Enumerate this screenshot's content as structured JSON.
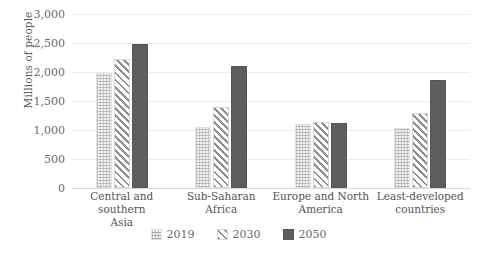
{
  "chart_data": {
    "type": "bar",
    "title": "",
    "xlabel": "",
    "ylabel": "Millions of people",
    "ylim": [
      0,
      3000
    ],
    "ytick_labels": [
      "3,000",
      "2,500",
      "2,000",
      "1,500",
      "1,000",
      "500",
      "0"
    ],
    "ytick_values": [
      3000,
      2500,
      2000,
      1500,
      1000,
      500,
      0
    ],
    "grid": true,
    "legend_position": "bottom",
    "categories": [
      "Central and southern Asia",
      "Sub-Saharan Africa",
      "Europe and North America",
      "Least-developed countries"
    ],
    "category_lines": [
      [
        "Central and southern",
        "Asia"
      ],
      [
        "Sub-Saharan",
        "Africa"
      ],
      [
        "Europe and North",
        "America"
      ],
      [
        "Least-developed",
        "countries"
      ]
    ],
    "series": [
      {
        "name": "2019",
        "pattern": "dotted-grid",
        "color": "#f2f2f2",
        "values": [
          1980,
          1060,
          1110,
          1030
        ]
      },
      {
        "name": "2030",
        "pattern": "diagonal-hatch",
        "color": "#8f8f8f",
        "values": [
          2220,
          1400,
          1140,
          1300
        ]
      },
      {
        "name": "2050",
        "pattern": "solid",
        "color": "#5e5e5e",
        "values": [
          2490,
          2110,
          1120,
          1870
        ]
      }
    ]
  },
  "legend": {
    "items": [
      {
        "label": "2019"
      },
      {
        "label": "2030"
      },
      {
        "label": "2050"
      }
    ]
  },
  "colors": {
    "series_2019": "#f2f2f2",
    "series_2030": "#8f8f8f",
    "series_2050": "#5e5e5e",
    "gridline": "#ececec",
    "text": "#5a5a5a",
    "background": "#ffffff"
  }
}
